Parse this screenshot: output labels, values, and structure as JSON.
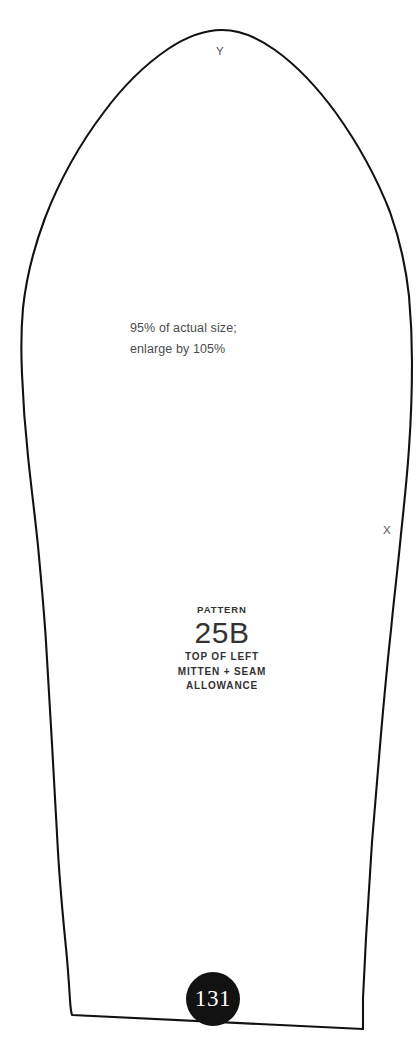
{
  "page": {
    "background_color": "#ffffff",
    "ink_color": "#111111",
    "page_number": "131",
    "badge_color": "#121212",
    "badge_text_color": "#ffffff"
  },
  "scale_note": {
    "line1": "95% of actual size;",
    "line2": "enlarge by 105%",
    "color": "#4c4c4c"
  },
  "pattern_label": {
    "kicker": "PATTERN",
    "number": "25B",
    "description_line1": "TOP OF LEFT",
    "description_line2": "MITTEN + SEAM",
    "description_line3": "ALLOWANCE",
    "color": "#333333"
  },
  "markers": {
    "top_notch": "Y",
    "side_notch": "X"
  },
  "outline": {
    "type": "sewing-pattern-piece",
    "stroke_color": "#111111",
    "stroke_width": 2.1,
    "fill": "none"
  }
}
